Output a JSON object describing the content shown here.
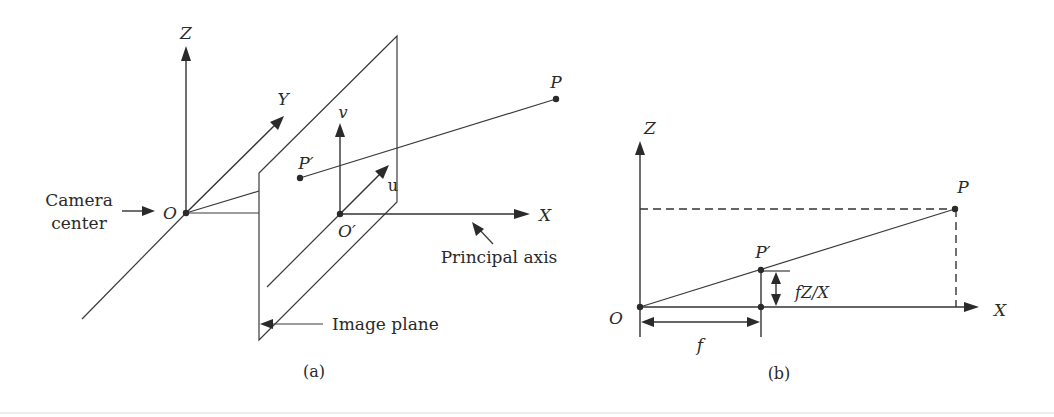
{
  "figure": {
    "panel_a": {
      "caption": "(a)",
      "axes": {
        "z": "Z",
        "y": "Y",
        "x": "X",
        "v": "v",
        "u": "u"
      },
      "points": {
        "origin": "O",
        "principal_point": "O′",
        "scene_point": "P",
        "image_point": "P′"
      },
      "annotations": {
        "camera_center_line1": "Camera",
        "camera_center_line2": "center",
        "principal_axis": "Principal axis",
        "image_plane": "Image plane"
      }
    },
    "panel_b": {
      "caption": "(b)",
      "axes": {
        "z": "Z",
        "x": "X"
      },
      "points": {
        "origin": "O",
        "scene_point": "P",
        "image_point": "P′"
      },
      "annotations": {
        "focal_length": "f",
        "projected_height": "fZ/X"
      }
    }
  },
  "colors": {
    "ink": "#2a2a2a",
    "background": "#ffffff"
  }
}
